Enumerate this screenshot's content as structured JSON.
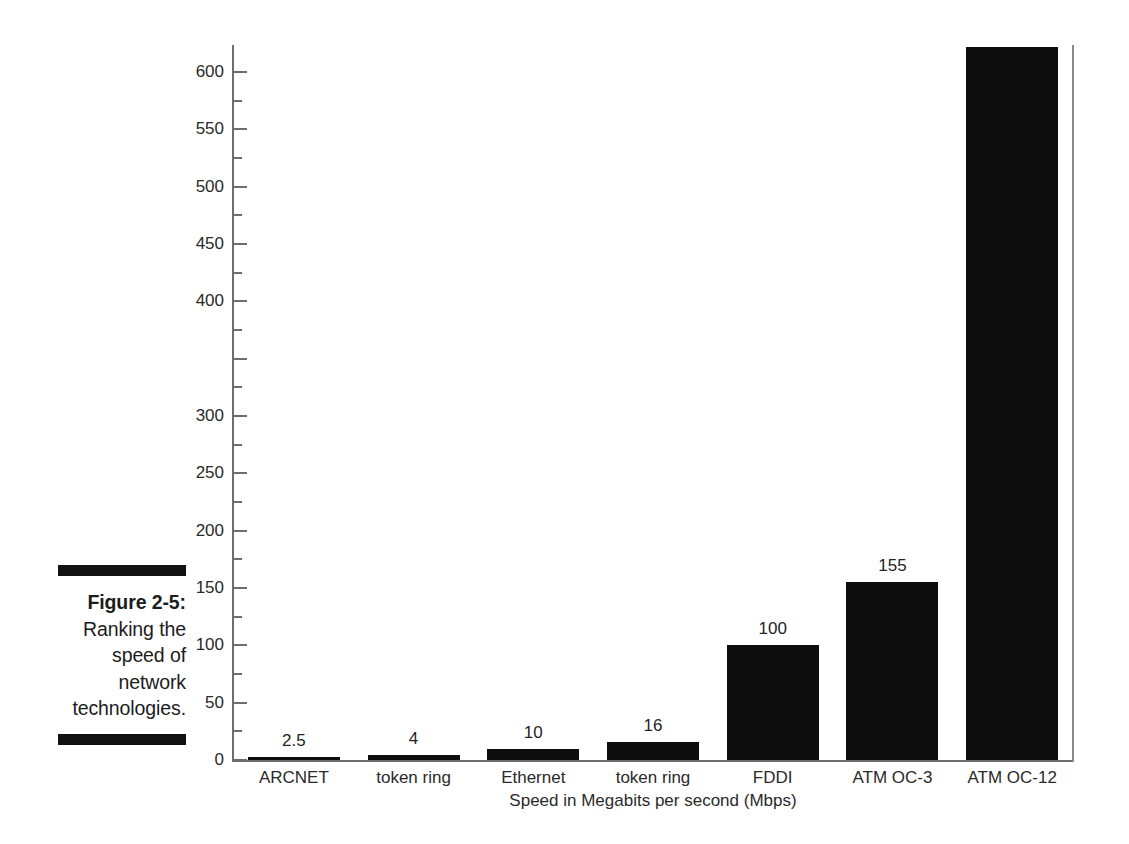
{
  "figure": {
    "caption_title": "Figure 2-5:",
    "caption_body": " Ranking the speed of network technologies.",
    "rule_color": "#121212"
  },
  "chart_data": {
    "type": "bar",
    "title": "",
    "subtitle": "",
    "xlabel": "Speed in Megabits per second (Mbps)",
    "ylabel": "",
    "categories": [
      "ARCNET",
      "token ring",
      "Ethernet",
      "token ring",
      "FDDI",
      "ATM OC-3",
      "ATM OC-12"
    ],
    "values": [
      2.5,
      4,
      10,
      16,
      100,
      155,
      622
    ],
    "data_labels": [
      "2.5",
      "4",
      "10",
      "16",
      "100",
      "155",
      ""
    ],
    "ylim": [
      0,
      620
    ],
    "ytick_major": [
      0,
      50,
      100,
      150,
      200,
      250,
      300,
      350,
      400,
      450,
      500,
      550,
      600
    ],
    "ytick_labels": [
      "0",
      "50",
      "100",
      "150",
      "200",
      "250",
      "300",
      "",
      "400",
      "450",
      "500",
      "550",
      "600"
    ],
    "ytick_minor_step": 25,
    "grid": false,
    "legend": "none",
    "bar_color": "#0d0d0d",
    "axis_color": "#6e6e6e",
    "orientation": "vertical"
  }
}
